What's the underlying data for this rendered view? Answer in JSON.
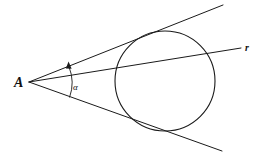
{
  "figure": {
    "background_color": "#ffffff",
    "stroke_color": "#1a1a1a",
    "width": 261,
    "height": 157,
    "labels": {
      "vertex_point": "A",
      "secant_line": "r",
      "angle": "α"
    },
    "geometry": {
      "vertex": {
        "x": 29,
        "y": 82
      },
      "circle": {
        "cx": 165,
        "cy": 81,
        "r": 50
      },
      "upper_tangent": {
        "x1": 29,
        "y1": 82,
        "x2": 223,
        "y2": 5
      },
      "lower_tangent": {
        "x1": 29,
        "y1": 82,
        "x2": 222,
        "y2": 151
      },
      "secant": {
        "x1": 29,
        "y1": 82,
        "x2": 241,
        "y2": 48
      },
      "angle_arc": {
        "cx": 29,
        "cy": 82,
        "radius": 43
      },
      "label_A_pos": {
        "x": 14,
        "y": 87
      },
      "label_r_pos": {
        "x": 245,
        "y": 51
      },
      "label_alpha_pos": {
        "x": 73,
        "y": 90
      }
    }
  }
}
